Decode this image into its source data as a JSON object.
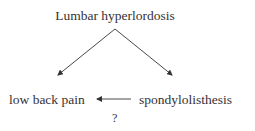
{
  "diagram": {
    "nodes": {
      "top": "Lumbar hyperlordosis",
      "left": "low back pain",
      "right": "spondylolisthesis"
    },
    "edges": [
      {
        "from": "top",
        "to": "left"
      },
      {
        "from": "top",
        "to": "right"
      },
      {
        "from": "right",
        "to": "left",
        "label": "?"
      }
    ],
    "edge_label": "?"
  }
}
